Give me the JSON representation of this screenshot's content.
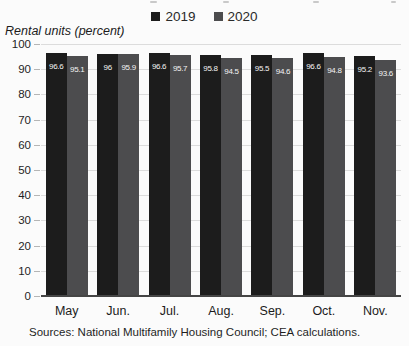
{
  "axis_title": "Rental units (percent)",
  "source_line": "Sources: National Multifamily Housing Council; CEA calculations.",
  "colors": {
    "series_2019": "#1c1c1c",
    "series_2020": "#4c4c4e",
    "gridline": "#dcdcdc",
    "baseline": "#454545",
    "value_label": "#f4f4f4",
    "background": "#fbfbfb"
  },
  "chart_data": {
    "type": "bar",
    "categories": [
      "May",
      "Jun.",
      "Jul.",
      "Aug.",
      "Sep.",
      "Oct.",
      "Nov."
    ],
    "series": [
      {
        "name": "2019",
        "color": "#1c1c1c",
        "values": [
          96.6,
          96,
          96.6,
          95.8,
          95.5,
          96.6,
          95.2
        ]
      },
      {
        "name": "2020",
        "color": "#4c4c4e",
        "values": [
          95.1,
          95.9,
          95.7,
          94.5,
          94.6,
          94.8,
          93.6
        ]
      }
    ],
    "title": "",
    "xlabel": "",
    "ylabel": "Rental units (percent)",
    "ylim": [
      0,
      100
    ],
    "yticks": [
      0,
      10,
      20,
      30,
      40,
      50,
      60,
      70,
      80,
      90,
      100
    ],
    "grid": true,
    "legend_position": "top",
    "value_labels": true
  }
}
